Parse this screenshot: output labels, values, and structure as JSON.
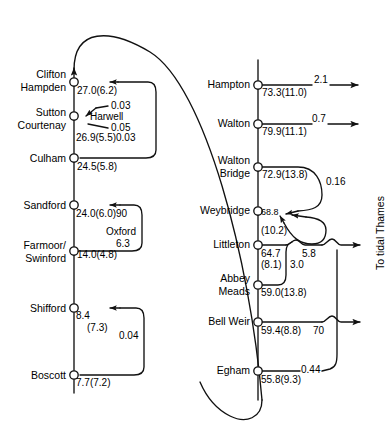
{
  "figure": {
    "type": "river-network-flow-diagram",
    "stroke_color": "#111111",
    "background": "#ffffff"
  },
  "left_branch": {
    "name": "Upper Thames reach",
    "stations": [
      {
        "name": "Clifton Hampden",
        "label_lines": "Clifton\nHampden",
        "value": "27.0(6.2)"
      },
      {
        "name": "Sutton Courtenay",
        "label_lines": "Sutton\nCourtenay",
        "value": "26.9(5.5)0.03"
      },
      {
        "name": "Culham",
        "label_lines": "Culham",
        "value": "24.5(5.8)"
      },
      {
        "name": "Sandford",
        "label_lines": "Sandford",
        "value": "24.0(6.0)90"
      },
      {
        "name": "Farmoor/Swinford",
        "label_lines": "Farmoor/\nSwinford",
        "value": "14.0(4.8)"
      },
      {
        "name": "Shifford",
        "label_lines": "Shifford",
        "value": "8.4"
      },
      {
        "name": "Boscott",
        "label_lines": "Boscott",
        "value": "7.7(7.2)"
      }
    ],
    "annotations": [
      {
        "id": "harwell-in",
        "text": "0.03"
      },
      {
        "id": "harwell",
        "text": "Harwell"
      },
      {
        "id": "harwell-out",
        "text": "0.05"
      },
      {
        "id": "oxford",
        "text": "Oxford"
      },
      {
        "id": "oxford-flow",
        "text": "6.3"
      },
      {
        "id": "shifford-paren",
        "text": "(7.3)"
      },
      {
        "id": "boscott-loop",
        "text": "0.04"
      }
    ]
  },
  "right_branch": {
    "name": "Lower Thames reach",
    "stations": [
      {
        "name": "Hampton",
        "label_lines": "Hampton",
        "value": "73.3(11.0)"
      },
      {
        "name": "Walton",
        "label_lines": "Walton",
        "value": "79.9(11.1)"
      },
      {
        "name": "Walton Bridge",
        "label_lines": "Walton\nBridge",
        "value": "72.9(13.8)"
      },
      {
        "name": "Weybridge",
        "label_lines": "Weybridge",
        "value": "68.8"
      },
      {
        "name": "Littleton",
        "label_lines": "Littleton",
        "value": "64.7"
      },
      {
        "name": "Abbey Meads",
        "label_lines": "Abbey\nMeads",
        "value": "59.0(13.8)"
      },
      {
        "name": "Bell Weir",
        "label_lines": "Bell Weir",
        "value": "59.4(8.8)"
      },
      {
        "name": "Egham",
        "label_lines": "Egham",
        "value": "55.8(9.3)"
      }
    ],
    "annotations": [
      {
        "id": "hampton-out",
        "text": "2.1"
      },
      {
        "id": "walton-out",
        "text": "0.7"
      },
      {
        "id": "walton-bridge-loop",
        "text": "0.16"
      },
      {
        "id": "weybridge-paren",
        "text": "(10.2)"
      },
      {
        "id": "littleton-paren",
        "text": "(8.1)"
      },
      {
        "id": "littleton-3",
        "text": "3.0"
      },
      {
        "id": "littleton-58",
        "text": "5.8"
      },
      {
        "id": "bell-weir-70",
        "text": "70"
      },
      {
        "id": "egham-044",
        "text": "0.44"
      }
    ],
    "outflow_label": "To tidal Thames"
  }
}
